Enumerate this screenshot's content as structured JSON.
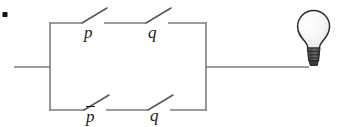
{
  "figure": {
    "kind": "switching-circuit-diagram",
    "width": 337,
    "height": 127,
    "background_color": "#ffffff",
    "wire_color": "#7d7d82",
    "ink_color": "#1a1a1a",
    "bullet_color": "#111111"
  },
  "circuit": {
    "left_terminal_label": "",
    "right_terminal_label": "",
    "branches": [
      {
        "position": "top",
        "switches": [
          {
            "id": "p-top",
            "label": "p",
            "negated": false,
            "state": "open"
          },
          {
            "id": "q-top",
            "label": "q",
            "negated": false,
            "state": "open"
          }
        ]
      },
      {
        "position": "bottom",
        "switches": [
          {
            "id": "p-bottom",
            "label": "p",
            "negated": true,
            "state": "open"
          },
          {
            "id": "q-bottom",
            "label": "q",
            "negated": false,
            "state": "open"
          }
        ]
      }
    ]
  },
  "labels": {
    "p_top": "p",
    "q_top": "q",
    "p_bottom": "p",
    "q_bottom": "q"
  },
  "lamp": {
    "name": "light-bulb",
    "glass_color": "#fbfbfb",
    "glass_outline_color": "#2b2b2b",
    "base_color": "#5a5a5e",
    "base_outline_color": "#2b2b2b",
    "state": "off"
  }
}
